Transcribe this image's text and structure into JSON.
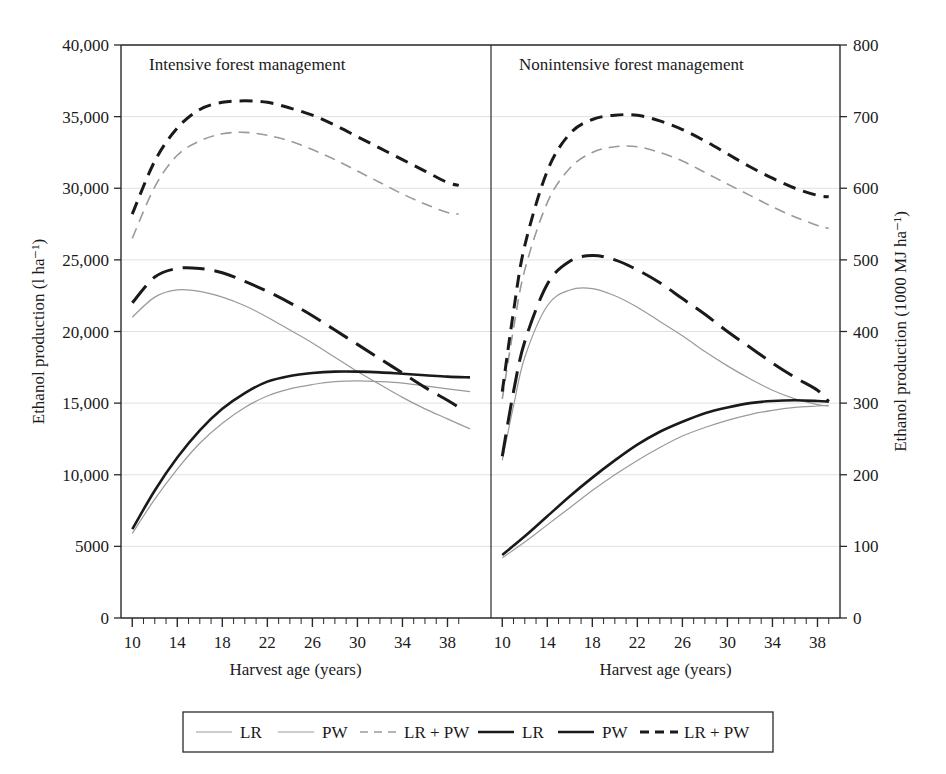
{
  "chart_data": {
    "type": "line",
    "title": "",
    "xlabel": "Harvest age (years)",
    "ylabel": "Ethanol production (l ha⁻¹)",
    "ylabel_right": "Ethanol production (1000 MJ ha⁻¹)",
    "xlim": [
      9,
      40
    ],
    "ylim": [
      0,
      40000
    ],
    "ylim_right": [
      0,
      800
    ],
    "grid": true,
    "legend_position": "bottom",
    "xticks": [
      10,
      14,
      18,
      22,
      26,
      30,
      34,
      38
    ],
    "xtick_labels": [
      "10",
      "14",
      "18",
      "22",
      "26",
      "30",
      "34",
      "38"
    ],
    "xminor_step": 1,
    "yticks": [
      0,
      5000,
      10000,
      15000,
      20000,
      25000,
      30000,
      35000,
      40000
    ],
    "ytick_labels": [
      "0",
      "5000",
      "10,000",
      "15,000",
      "20,000",
      "25,000",
      "30,000",
      "35,000",
      "40,000"
    ],
    "yticks_right": [
      0,
      100,
      200,
      300,
      400,
      500,
      600,
      700,
      800
    ],
    "ytick_labels_right": [
      "0",
      "100",
      "200",
      "300",
      "400",
      "500",
      "600",
      "700",
      "800"
    ],
    "panels": [
      {
        "id": "intensive",
        "title": "Intensive forest management",
        "series": [
          {
            "name": "LR",
            "style": "thin-gray-solid",
            "color": "#9a9a9a",
            "x": [
              10,
              12,
              14,
              16,
              18,
              20,
              22,
              24,
              26,
              28,
              30,
              32,
              34,
              36,
              38,
              40
            ],
            "y": [
              5900,
              8300,
              10400,
              12200,
              13600,
              14700,
              15500,
              16000,
              16300,
              16500,
              16550,
              16500,
              16400,
              16200,
              16000,
              15800
            ]
          },
          {
            "name": "PW",
            "style": "thin-gray-solid",
            "color": "#9a9a9a",
            "x": [
              10,
              12,
              14,
              16,
              18,
              20,
              22,
              24,
              26,
              28,
              30,
              32,
              34,
              36,
              38,
              40
            ],
            "y": [
              21000,
              22400,
              22900,
              22800,
              22400,
              21800,
              21000,
              20100,
              19200,
              18200,
              17200,
              16300,
              15400,
              14600,
              13900,
              13200
            ]
          },
          {
            "name": "LR + PW",
            "style": "dashed-gray",
            "color": "#9a9a9a",
            "x": [
              10,
              12,
              14,
              16,
              18,
              20,
              22,
              24,
              26,
              28,
              30,
              32,
              34,
              36,
              38,
              39
            ],
            "y": [
              26500,
              30100,
              32300,
              33300,
              33800,
              33900,
              33700,
              33300,
              32700,
              32000,
              31200,
              30400,
              29600,
              28900,
              28300,
              28200
            ]
          },
          {
            "name": "LR",
            "style": "thick-black-solid",
            "color": "#1a1a1a",
            "x": [
              10,
              12,
              14,
              16,
              18,
              20,
              22,
              24,
              26,
              28,
              30,
              32,
              34,
              36,
              38,
              40
            ],
            "y": [
              6200,
              8900,
              11200,
              13100,
              14600,
              15700,
              16500,
              16900,
              17100,
              17200,
              17200,
              17150,
              17050,
              16950,
              16850,
              16800
            ]
          },
          {
            "name": "PW",
            "style": "long-dash-black",
            "color": "#1a1a1a",
            "x": [
              10,
              12,
              14,
              16,
              18,
              20,
              22,
              24,
              26,
              28,
              30,
              32,
              34,
              36,
              38,
              39
            ],
            "y": [
              22000,
              23800,
              24400,
              24400,
              24100,
              23500,
              22800,
              22000,
              21100,
              20100,
              19100,
              18100,
              17100,
              16100,
              15200,
              14700
            ]
          },
          {
            "name": "LR + PW",
            "style": "dashed-black",
            "color": "#1a1a1a",
            "x": [
              10,
              12,
              14,
              16,
              18,
              20,
              22,
              24,
              26,
              28,
              30,
              32,
              34,
              36,
              38,
              39
            ],
            "y": [
              28200,
              31900,
              34200,
              35500,
              36000,
              36100,
              36000,
              35600,
              35100,
              34400,
              33600,
              32800,
              32000,
              31200,
              30400,
              30200
            ]
          }
        ]
      },
      {
        "id": "nonintensive",
        "title": "Nonintensive forest management",
        "series": [
          {
            "name": "LR",
            "style": "thin-gray-solid",
            "color": "#9a9a9a",
            "x": [
              10,
              12,
              14,
              16,
              18,
              20,
              22,
              24,
              26,
              28,
              30,
              32,
              34,
              36,
              38,
              39
            ],
            "y": [
              4200,
              5300,
              6500,
              7700,
              8900,
              10000,
              11000,
              11900,
              12700,
              13300,
              13800,
              14200,
              14500,
              14700,
              14800,
              14850
            ]
          },
          {
            "name": "PW",
            "style": "thin-gray-solid",
            "color": "#9a9a9a",
            "x": [
              10,
              11,
              12,
              14,
              16,
              18,
              20,
              22,
              24,
              26,
              28,
              30,
              32,
              34,
              36,
              38,
              39
            ],
            "y": [
              11000,
              14800,
              18200,
              21800,
              22900,
              23000,
              22500,
              21700,
              20700,
              19700,
              18600,
              17600,
              16700,
              15900,
              15300,
              14900,
              14800
            ]
          },
          {
            "name": "LR + PW",
            "style": "dashed-gray",
            "color": "#9a9a9a",
            "x": [
              10,
              11,
              12,
              14,
              16,
              18,
              20,
              22,
              24,
              26,
              28,
              30,
              32,
              34,
              36,
              38,
              39
            ],
            "y": [
              15300,
              20200,
              24300,
              29000,
              31400,
              32500,
              32900,
              32900,
              32500,
              31900,
              31100,
              30300,
              29500,
              28700,
              28000,
              27400,
              27200
            ]
          },
          {
            "name": "LR",
            "style": "thick-black-solid",
            "color": "#1a1a1a",
            "x": [
              10,
              12,
              14,
              16,
              18,
              20,
              22,
              24,
              26,
              28,
              30,
              32,
              34,
              36,
              38,
              39
            ],
            "y": [
              4400,
              5700,
              7100,
              8500,
              9800,
              11000,
              12100,
              13000,
              13700,
              14300,
              14700,
              15000,
              15150,
              15200,
              15150,
              15100
            ]
          },
          {
            "name": "PW",
            "style": "long-dash-black",
            "color": "#1a1a1a",
            "x": [
              10,
              11,
              12,
              14,
              16,
              18,
              20,
              22,
              24,
              26,
              28,
              30,
              32,
              34,
              36,
              38,
              39
            ],
            "y": [
              11300,
              15800,
              19300,
              23300,
              24900,
              25300,
              25000,
              24300,
              23400,
              22300,
              21200,
              20000,
              18900,
              17800,
              16800,
              15900,
              15100
            ]
          },
          {
            "name": "LR + PW",
            "style": "dashed-black",
            "color": "#1a1a1a",
            "x": [
              10,
              11,
              12,
              14,
              16,
              18,
              20,
              22,
              24,
              26,
              28,
              30,
              32,
              34,
              36,
              38,
              39
            ],
            "y": [
              15800,
              21400,
              26000,
              31200,
              33800,
              34800,
              35100,
              35100,
              34700,
              34100,
              33300,
              32400,
              31500,
              30700,
              30000,
              29500,
              29400
            ]
          }
        ]
      }
    ],
    "legend": [
      {
        "label": "LR",
        "style": "thin-gray-solid",
        "color": "#9a9a9a"
      },
      {
        "label": "PW",
        "style": "thin-gray-solid",
        "color": "#9a9a9a"
      },
      {
        "label": "LR + PW",
        "style": "dashed-gray",
        "color": "#9a9a9a"
      },
      {
        "label": "LR",
        "style": "thick-black-solid",
        "color": "#1a1a1a"
      },
      {
        "label": "PW",
        "style": "thick-black-solid",
        "color": "#1a1a1a"
      },
      {
        "label": "LR + PW",
        "style": "dashed-black",
        "color": "#1a1a1a"
      }
    ]
  }
}
